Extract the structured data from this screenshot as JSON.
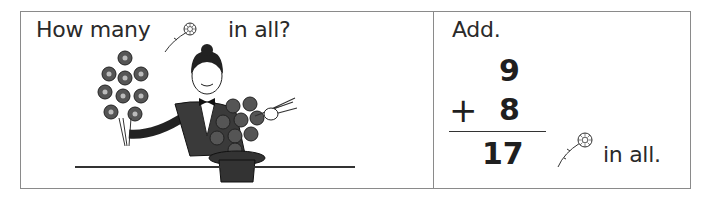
{
  "left_panel": {
    "prompt_before": "How many",
    "prompt_icon": "flower-icon",
    "prompt_after": "in all?",
    "illustration": "magician-pulling-flowers-from-top-hat"
  },
  "right_panel": {
    "instruction": "Add.",
    "addend_top": "9",
    "operator": "+",
    "addend_bottom": "8",
    "sum": "17",
    "answer_icon": "flower-icon",
    "answer_suffix": "in all."
  }
}
